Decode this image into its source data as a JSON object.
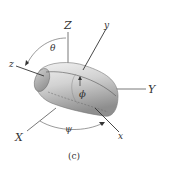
{
  "figure": {
    "caption": "(c)",
    "axes": {
      "Z": "Z",
      "Y": "Y",
      "X": "X",
      "z": "z",
      "y": "y",
      "x": "x"
    },
    "angles": {
      "theta": "θ",
      "phi": "ϕ",
      "psi": "ψ"
    },
    "colors": {
      "line": "#333333",
      "body_light": "#e6e6e6",
      "body_dark": "#9a9a9a"
    }
  }
}
